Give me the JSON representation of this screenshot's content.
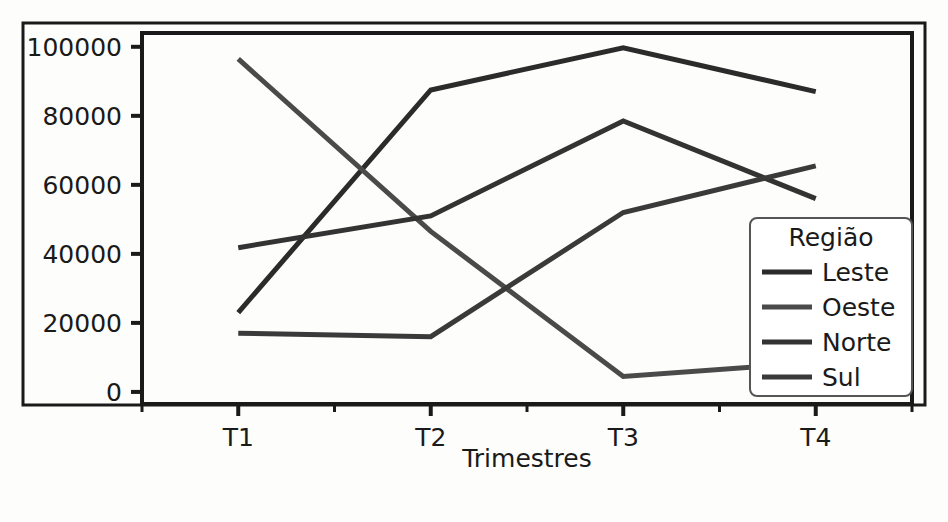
{
  "chart_data": {
    "type": "line",
    "title": "",
    "subtitle": "",
    "xlabel": "Trimestres",
    "ylabel": "",
    "categories": [
      "T1",
      "T2",
      "T3",
      "T4"
    ],
    "x_tick_labels": [
      "T1",
      "T2",
      "T3",
      "T4"
    ],
    "y_tick_labels": [
      "0",
      "20000",
      "40000",
      "60000",
      "80000",
      "100000"
    ],
    "y_ticks": [
      0,
      20000,
      40000,
      60000,
      80000,
      100000
    ],
    "ylim": [
      -3500,
      104000
    ],
    "xlim": [
      -0.5,
      3.5
    ],
    "grid": false,
    "legend": {
      "title": "Região",
      "position": "lower-right",
      "entries": [
        "Leste",
        "Oeste",
        "Norte",
        "Sul"
      ]
    },
    "series": [
      {
        "name": "Leste",
        "color": "#2b2b2b",
        "values": [
          23000,
          87500,
          99700,
          87000
        ]
      },
      {
        "name": "Oeste",
        "color": "#4a4a4a",
        "values": [
          96500,
          46500,
          4500,
          8500
        ]
      },
      {
        "name": "Norte",
        "color": "#333333",
        "values": [
          41800,
          51000,
          78500,
          56000
        ]
      },
      {
        "name": "Sul",
        "color": "#3a3a3a",
        "values": [
          17000,
          16000,
          52000,
          65500
        ]
      }
    ]
  },
  "figure": {
    "background": "#fdfdfb",
    "outer_border_color": "#1a1a1a",
    "axes_border_color": "#1a1a1a",
    "legend_border_color": "#555555",
    "legend_background": "#ffffff",
    "tick_color": "#1a1a1a",
    "text_color": "#1a1a1a"
  }
}
